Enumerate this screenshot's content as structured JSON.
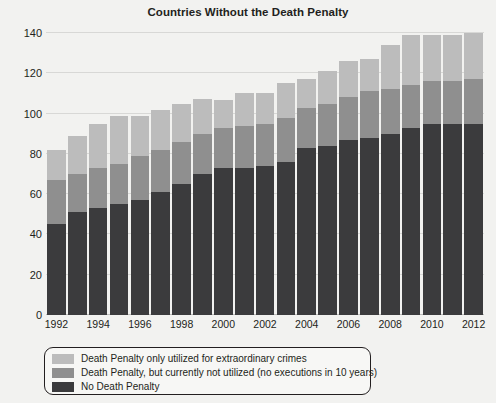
{
  "chart_data": {
    "type": "bar",
    "subtype": "stacked-bar",
    "title": "Countries Without the Death Penalty",
    "xlabel": "",
    "ylabel": "",
    "ylim": [
      0,
      140
    ],
    "ytick_step": 20,
    "yticks": [
      0,
      20,
      40,
      60,
      80,
      100,
      120,
      140
    ],
    "ytick_labels": [
      "0",
      "20",
      "40",
      "60",
      "80",
      "100",
      "120",
      "140"
    ],
    "grid": true,
    "legend_position": "below-plot-left",
    "categories": [
      "1992",
      "1993",
      "1994",
      "1995",
      "1996",
      "1997",
      "1998",
      "1999",
      "2000",
      "2001",
      "2002",
      "2003",
      "2004",
      "2005",
      "2006",
      "2007",
      "2008",
      "2009",
      "2010",
      "2011",
      "2012"
    ],
    "xtick_labels_shown": [
      "1992",
      "",
      "1994",
      "",
      "1996",
      "",
      "1998",
      "",
      "2000",
      "",
      "2002",
      "",
      "2004",
      "",
      "2006",
      "",
      "2008",
      "",
      "2010",
      "",
      "2012"
    ],
    "series": [
      {
        "name": "No Death Penalty",
        "color": "#3b3b3d",
        "values": [
          45,
          51,
          53,
          55,
          57,
          61,
          65,
          70,
          73,
          73,
          74,
          76,
          83,
          84,
          87,
          88,
          90,
          93,
          95,
          95,
          95
        ]
      },
      {
        "name": "Death Penalty, but currently not utilized (no executions in 10 years)",
        "color": "#8f8f8f",
        "values": [
          22,
          19,
          20,
          20,
          22,
          21,
          21,
          20,
          20,
          21,
          21,
          22,
          20,
          21,
          21,
          23,
          22,
          21,
          21,
          21,
          22
        ]
      },
      {
        "name": "Death Penalty only utilized for extraordinary crimes",
        "color": "#bcbcbc",
        "values": [
          15,
          19,
          22,
          24,
          20,
          20,
          19,
          17,
          14,
          16,
          15,
          17,
          14,
          16,
          18,
          16,
          22,
          25,
          23,
          23,
          23
        ]
      }
    ],
    "totals": [
      82,
      89,
      95,
      99,
      99,
      102,
      105,
      107,
      107,
      110,
      110,
      115,
      117,
      121,
      126,
      127,
      134,
      139,
      139,
      139,
      140
    ]
  },
  "legend": {
    "items": [
      {
        "label": "Death Penalty only utilized for extraordinary crimes",
        "color": "#bcbcbc"
      },
      {
        "label": "Death Penalty, but currently not utilized (no executions in 10 years)",
        "color": "#8f8f8f"
      },
      {
        "label": "No Death Penalty",
        "color": "#3b3b3d"
      }
    ]
  },
  "colors": {
    "background": "#f2f2f0",
    "text": "#231f20",
    "gridline": "#d8d8d6",
    "legend_border": "#231f20"
  }
}
